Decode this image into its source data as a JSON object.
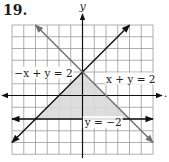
{
  "problem_number": "19.",
  "colors": {
    "grid": "#9a9a9a",
    "axis": "#111111",
    "line_dark": "#111111",
    "line_gray": "#6e6e6e",
    "shade": "#d9d9d9",
    "text": "#222222"
  },
  "chart_data": {
    "type": "line",
    "title": "19.",
    "xlabel": "",
    "ylabel": "y",
    "xlim": [
      -6,
      6
    ],
    "ylim": [
      -5,
      6
    ],
    "grid": true,
    "grid_step": 1,
    "series": [
      {
        "name": "-x + y = 2",
        "equation": "y = x + 2",
        "points": [
          [
            -6,
            -4
          ],
          [
            4,
            6
          ]
        ],
        "color": "#111111",
        "label": "−x + y = 2"
      },
      {
        "name": "x + y = 2",
        "equation": "y = -x + 2",
        "points": [
          [
            -4,
            6
          ],
          [
            6,
            -4
          ]
        ],
        "color": "#6e6e6e",
        "label": "x + y = 2"
      },
      {
        "name": "y = -2",
        "equation": "y = -2",
        "points": [
          [
            -6,
            -2
          ],
          [
            6,
            -2
          ]
        ],
        "color": "#111111",
        "label": "y = −2"
      }
    ],
    "shaded_region": {
      "description": "Solution region of the system (triangle)",
      "vertices": [
        [
          0,
          2
        ],
        [
          -4,
          -2
        ],
        [
          4,
          -2
        ]
      ],
      "color": "#d9d9d9"
    },
    "annotations": [
      {
        "text": "−x + y = 2",
        "position": [
          -5.8,
          1.6
        ]
      },
      {
        "text": "x + y = 2",
        "position": [
          2.0,
          1.1
        ]
      },
      {
        "text": "y = −2",
        "position": [
          0.2,
          -2.6
        ]
      }
    ]
  }
}
